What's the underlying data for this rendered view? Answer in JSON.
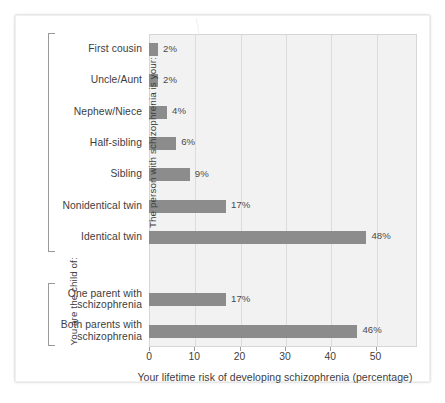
{
  "chart_data": {
    "type": "bar",
    "orientation": "horizontal",
    "title": "",
    "xlabel": "Your lifetime risk of developing schizophrenia (percentage)",
    "ylabel": "",
    "xlim": [
      0,
      59
    ],
    "xticks": [
      0,
      10,
      20,
      30,
      40,
      50
    ],
    "xtick_labels": [
      "0",
      "10",
      "20",
      "30",
      "40",
      "50"
    ],
    "grid": "vertical",
    "legend": "none",
    "bar_color": "#8c8c8c",
    "plot_background": "#f2f2f2",
    "categories": [
      "First cousin",
      "Uncle/Aunt",
      "Nephew/Niece",
      "Half-sibling",
      "Sibling",
      "Nonidentical twin",
      "Identical twin",
      "One parent with schizophrenia",
      "Both parents with schizophrenia"
    ],
    "values": [
      2,
      2,
      4,
      6,
      9,
      17,
      48,
      17,
      46
    ],
    "value_labels": [
      "2%",
      "2%",
      "4%",
      "6%",
      "9%",
      "17%",
      "48%",
      "17%",
      "46%"
    ],
    "bars": [
      {
        "category": "First cousin",
        "lines": [
          "First cousin"
        ],
        "value": 2,
        "label": "2%"
      },
      {
        "category": "Uncle/Aunt",
        "lines": [
          "Uncle/Aunt"
        ],
        "value": 2,
        "label": "2%"
      },
      {
        "category": "Nephew/Niece",
        "lines": [
          "Nephew/Niece"
        ],
        "value": 4,
        "label": "4%"
      },
      {
        "category": "Half-sibling",
        "lines": [
          "Half-sibling"
        ],
        "value": 6,
        "label": "6%"
      },
      {
        "category": "Sibling",
        "lines": [
          "Sibling"
        ],
        "value": 9,
        "label": "9%"
      },
      {
        "category": "Nonidentical twin",
        "lines": [
          "Nonidentical twin"
        ],
        "value": 17,
        "label": "17%"
      },
      {
        "category": "Identical twin",
        "lines": [
          "Identical twin"
        ],
        "value": 48,
        "label": "48%"
      },
      {
        "category": "One parent with schizophrenia",
        "lines": [
          "One parent with",
          "schizophrenia"
        ],
        "value": 17,
        "label": "17%"
      },
      {
        "category": "Both parents with schizophrenia",
        "lines": [
          "Both parents with",
          "schizophrenia"
        ],
        "value": 46,
        "label": "46%"
      }
    ],
    "groups": [
      {
        "label": "The person with schizophrenia is your:",
        "first_row": 0,
        "last_row": 6
      },
      {
        "label": "You are the child of:",
        "first_row": 7,
        "last_row": 8
      }
    ]
  }
}
